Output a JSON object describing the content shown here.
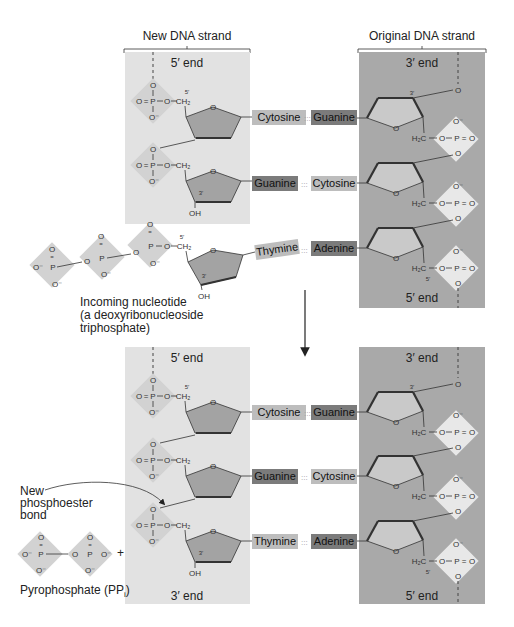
{
  "figure": {
    "headers": {
      "new_strand": "New DNA strand",
      "original_strand": "Original DNA strand"
    },
    "top_panel": {
      "new_strand_end_top": "5′ end",
      "original_strand_end_top": "3′ end",
      "original_strand_end_bottom": "5′ end",
      "pairs": [
        {
          "new_base": "Cytosine",
          "original_base": "Guanine",
          "new_shade": "light",
          "original_shade": "dark"
        },
        {
          "new_base": "Guanine",
          "original_base": "Cytosine",
          "new_shade": "dark",
          "original_shade": "light"
        },
        {
          "new_base": "Thymine",
          "original_base": "Adenine",
          "new_shade": "light",
          "original_shade": "dark"
        }
      ]
    },
    "incoming_nucleotide": {
      "label_line1": "Incoming nucleotide",
      "label_line2": "(a deoxyribonucleoside",
      "label_line3": "triphosphate)"
    },
    "bottom_panel": {
      "new_strand_end_top": "5′ end",
      "new_strand_end_bottom": "3′ end",
      "original_strand_end_top": "3′ end",
      "original_strand_end_bottom": "5′ end",
      "pairs": [
        {
          "new_base": "Cytosine",
          "original_base": "Guanine"
        },
        {
          "new_base": "Guanine",
          "original_base": "Cytosine"
        },
        {
          "new_base": "Thymine",
          "original_base": "Adenine"
        }
      ]
    },
    "annotations": {
      "new_bond_line1": "New",
      "new_bond_line2": "phosphoester",
      "new_bond_line3": "bond",
      "pyrophosphate": "Pyrophosphate (PP",
      "pyrophosphate_sub": "i",
      "pyrophosphate_close": ")",
      "plus": "+"
    },
    "chem": {
      "O": "O",
      "O_minus": "O⁻",
      "P": "P",
      "CH2": "CH₂",
      "H2C": "H₂C",
      "OH": "OH",
      "prime5": "5′",
      "prime3": "3′",
      "dbl": "=",
      "hbond": ":::"
    },
    "colors": {
      "new_strand_panel": "#e2e2e2",
      "original_strand_panel": "#a9a9a9",
      "base_light": "#bdbdbd",
      "base_dark": "#7b7b7b"
    }
  }
}
